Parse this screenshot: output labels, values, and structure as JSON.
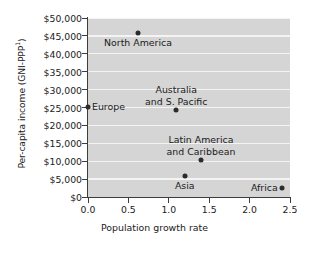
{
  "chart_data": {
    "type": "scatter",
    "title": "",
    "xlabel": "Population growth rate",
    "ylabel": "Per-capita income (GNI-PPP",
    "ylabel_superscript": "1",
    "ylabel_suffix": ")",
    "xlim": [
      0.0,
      2.5
    ],
    "ylim": [
      0,
      50000
    ],
    "grid": true,
    "grid_axis": "y",
    "legend": "none",
    "xticks": [
      "0.0",
      "0.5",
      "1.0",
      "1.5",
      "2.0",
      "2.5"
    ],
    "xtick_values": [
      0.0,
      0.5,
      1.0,
      1.5,
      2.0,
      2.5
    ],
    "yticks": [
      "$0",
      "$5,000",
      "$10,000",
      "$15,000",
      "$20,000",
      "$25,000",
      "$30,000",
      "$35,000",
      "$40,000",
      "$45,000",
      "$50,000"
    ],
    "ytick_values": [
      0,
      5000,
      10000,
      15000,
      20000,
      25000,
      30000,
      35000,
      40000,
      45000,
      50000
    ],
    "points": [
      {
        "name": "North America",
        "x": 0.62,
        "y": 45800,
        "label": "North America",
        "label_lines": [
          "North America"
        ],
        "label_position": "below"
      },
      {
        "name": "Europe",
        "x": 0.0,
        "y": 25100,
        "label": "Europe",
        "label_lines": [
          "Europe"
        ],
        "label_position": "right"
      },
      {
        "name": "Australia and S. Pacific",
        "x": 1.09,
        "y": 24200,
        "label": "Australia and S. Pacific",
        "label_lines": [
          "Australia",
          "and S. Pacific"
        ],
        "label_position": "above"
      },
      {
        "name": "Latin America and Caribbean",
        "x": 1.4,
        "y": 10200,
        "label": "Latin America and Caribbean",
        "label_lines": [
          "Latin America",
          "and Caribbean"
        ],
        "label_position": "above"
      },
      {
        "name": "Asia",
        "x": 1.2,
        "y": 6000,
        "label": "Asia",
        "label_lines": [
          "Asia"
        ],
        "label_position": "below"
      },
      {
        "name": "Africa",
        "x": 2.4,
        "y": 2600,
        "label": "Africa",
        "label_lines": [
          "Africa"
        ],
        "label_position": "left"
      }
    ],
    "colors": {
      "plot_background": "#d5d5d5",
      "gridline": "#f4f4f4",
      "marker": "#2b2b2b",
      "axis": "#3d3d3d",
      "text": "#1b1b1b",
      "figure_background": "#ffffff"
    }
  },
  "labels": {
    "ylabel_full": "Per-capita income (GNI-PPP1)",
    "north_america": "North America",
    "europe": "Europe",
    "australia_line1": "Australia",
    "australia_line2": "and S. Pacific",
    "latin_line1": "Latin America",
    "latin_line2": "and Caribbean",
    "asia": "Asia",
    "africa": "Africa",
    "xlabel": "Population growth rate",
    "ylabel_base": "Per-capita income (GNI-PPP",
    "ylabel_sup": "1",
    "ylabel_close": ")"
  }
}
